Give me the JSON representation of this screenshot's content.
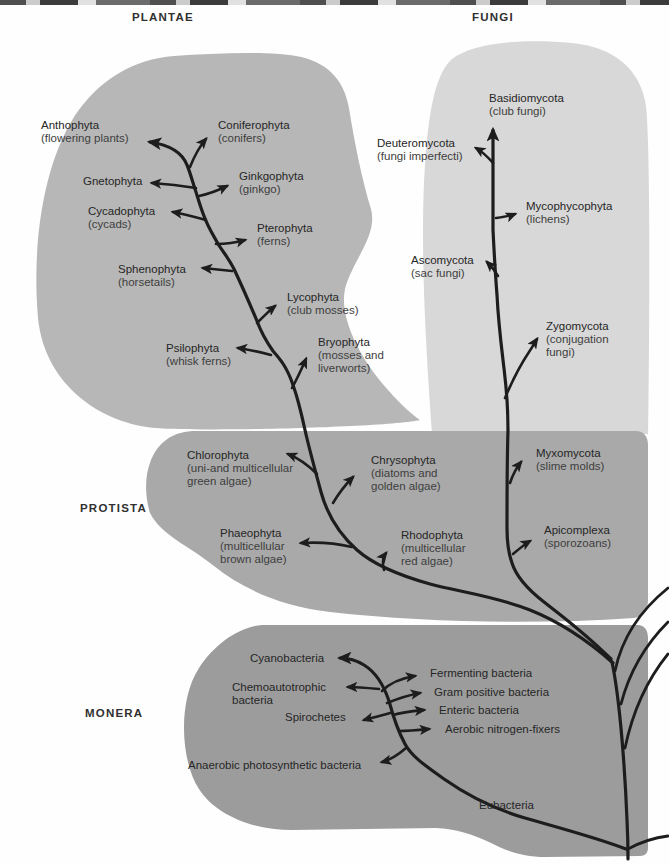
{
  "figure": {
    "type": "phylogenetic-tree-diagram",
    "kingdom_count_labels": [
      "PLANTAE",
      "FUNGI",
      "PROTISTA",
      "MONERA"
    ]
  },
  "kingdoms": {
    "plantae": {
      "title": "PLANTAE",
      "phyla": [
        {
          "name": "Anthophyta",
          "common": "(flowering plants)"
        },
        {
          "name": "Coniferophyta",
          "common": "(conifers)"
        },
        {
          "name": "Gnetophyta",
          "common": ""
        },
        {
          "name": "Ginkgophyta",
          "common": "(ginkgo)"
        },
        {
          "name": "Cycadophyta",
          "common": "(cycads)"
        },
        {
          "name": "Pterophyta",
          "common": "(ferns)"
        },
        {
          "name": "Sphenophyta",
          "common": "(horsetails)"
        },
        {
          "name": "Lycophyta",
          "common": "(club mosses)"
        },
        {
          "name": "Psilophyta",
          "common": "(whisk ferns)"
        },
        {
          "name": "Bryophyta",
          "common": "(mosses and\nliverworts)"
        }
      ]
    },
    "fungi": {
      "title": "FUNGI",
      "phyla": [
        {
          "name": "Basidiomycota",
          "common": "(club fungi)"
        },
        {
          "name": "Deuteromycota",
          "common": "(fungi imperfecti)"
        },
        {
          "name": "Mycophycophyta",
          "common": "(lichens)"
        },
        {
          "name": "Ascomycota",
          "common": "(sac fungi)"
        },
        {
          "name": "Zygomycota",
          "common": "(conjugation\nfungi)"
        }
      ]
    },
    "protista": {
      "title": "PROTISTA",
      "phyla": [
        {
          "name": "Chlorophyta",
          "common": "(uni-and multicellular\ngreen algae)"
        },
        {
          "name": "Phaeophyta",
          "common": "(multicellular\nbrown algae)"
        },
        {
          "name": "Chrysophyta",
          "common": "(diatoms and\ngolden algae)"
        },
        {
          "name": "Rhodophyta",
          "common": "(multicellular\nred algae)"
        },
        {
          "name": "Myxomycota",
          "common": "(slime molds)"
        },
        {
          "name": "Apicomplexa",
          "common": "(sporozoans)"
        }
      ]
    },
    "monera": {
      "title": "MONERA",
      "groups": [
        {
          "name": "Cyanobacteria"
        },
        {
          "name": "Chemoautotrophic\nbacteria"
        },
        {
          "name": "Spirochetes"
        },
        {
          "name": "Anaerobic photosynthetic bacteria"
        },
        {
          "name": "Fermenting bacteria"
        },
        {
          "name": "Gram positive bacteria"
        },
        {
          "name": "Enteric bacteria"
        },
        {
          "name": "Aerobic nitrogen-fixers"
        },
        {
          "name": "Eubacteria"
        }
      ]
    }
  },
  "colors": {
    "plantae-blob": "#b7b7b7",
    "fungi-blob": "#d8d8d8",
    "protista-blob": "#a9a9a9",
    "monera-blob": "#9c9c9c",
    "line": "#1d1d1d",
    "text": "#303030",
    "background": "#fefefe"
  }
}
